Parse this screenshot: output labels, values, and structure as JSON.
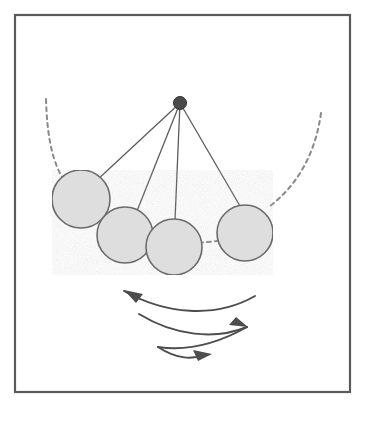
{
  "figure": {
    "title": "Pendulum swinging on a string",
    "type": "physics-diagram",
    "width": 366,
    "height": 421,
    "background_color": "#ffffff"
  },
  "frame": {
    "label": "figure-border",
    "x": 15,
    "y": 15,
    "width": 335,
    "height": 377,
    "stroke_color": "#5a5a5a",
    "stroke_width": 2.2,
    "fill": "none"
  },
  "pivot": {
    "label": "pivot-point",
    "cx": 180,
    "cy": 103,
    "r": 6.5,
    "fill_color": "#4a4a4a",
    "stroke_color": "#2e2e2e"
  },
  "strings": {
    "label": "pendulum-strings",
    "stroke_color": "#5c5c5c",
    "stroke_width": 1.3,
    "lines": [
      {
        "name": "string-to-ball-1",
        "x1": 180,
        "y1": 103,
        "x2": 96,
        "y2": 181
      },
      {
        "name": "string-to-ball-2",
        "x1": 180,
        "y1": 103,
        "x2": 137,
        "y2": 211
      },
      {
        "name": "string-to-ball-3",
        "x1": 180,
        "y1": 103,
        "x2": 175,
        "y2": 220
      },
      {
        "name": "string-to-ball-4",
        "x1": 180,
        "y1": 103,
        "x2": 240,
        "y2": 206
      }
    ]
  },
  "balls": {
    "label": "pendulum-bobs",
    "fill_color": "#dedede",
    "stroke_color": "#6b6b6b",
    "stroke_width": 1.6,
    "items": [
      {
        "name": "bob-position-1",
        "cx": 81,
        "cy": 199,
        "r": 29
      },
      {
        "name": "bob-position-2",
        "cx": 125,
        "cy": 235,
        "r": 28
      },
      {
        "name": "bob-position-3",
        "cx": 174,
        "cy": 247,
        "r": 28
      },
      {
        "name": "bob-position-4",
        "cx": 245,
        "cy": 233,
        "r": 28
      }
    ]
  },
  "dashed_arcs": {
    "label": "swing-path-arcs",
    "stroke_color": "#8a8a8a",
    "stroke_width": 2.0,
    "dash_pattern": "4 4",
    "items": [
      {
        "name": "arc-left-path",
        "path": "M 46 99 C 47 135, 52 164, 66 183"
      },
      {
        "name": "arc-right-path",
        "path": "M 321 113 C 316 150, 300 183, 270 206"
      },
      {
        "name": "arc-center-segment",
        "path": "M 199 243 L 217 241"
      }
    ]
  },
  "motion_arrows": {
    "label": "oscillation-arrows",
    "stroke_color": "#4d4d4d",
    "stroke_width": 2.0,
    "arrowhead_fill": "#4d4d4d",
    "items": [
      {
        "name": "arrow-swing-leftward",
        "path": "M 255 296 C 215 319, 165 314, 124 291",
        "head_points": "124,290 143,294 136,303",
        "direction": "left"
      },
      {
        "name": "arrow-swing-rightward-upper",
        "path": "M 139 314 C 175 336, 215 340, 247 327",
        "head_points": "248,327 229,325 236,317",
        "direction": "right"
      },
      {
        "name": "arrow-swing-leftward-lower",
        "path": "M 247 327 C 215 345, 185 351, 158 347",
        "direction": "left"
      },
      {
        "name": "arrow-swing-rightward-final",
        "path": "M 158 347 C 178 360, 192 359, 206 355",
        "head_points": "212,354 193,350 198,361",
        "direction": "right"
      }
    ]
  },
  "chart_data": {
    "type": "diagram",
    "title": "Pendulum swinging on a string",
    "elements": [
      {
        "kind": "pivot",
        "label": "fixed pivot",
        "x": 180,
        "y": 103
      },
      {
        "kind": "bob",
        "label": "position 1 (far left)",
        "x": 81,
        "y": 199,
        "radius": 29
      },
      {
        "kind": "bob",
        "label": "position 2",
        "x": 125,
        "y": 235,
        "radius": 28
      },
      {
        "kind": "bob",
        "label": "position 3",
        "x": 174,
        "y": 247,
        "radius": 28
      },
      {
        "kind": "bob",
        "label": "position 4 (right)",
        "x": 245,
        "y": 233,
        "radius": 28
      },
      {
        "kind": "arc",
        "label": "left swing extreme (dashed)"
      },
      {
        "kind": "arc",
        "label": "right swing extreme (dashed)"
      },
      {
        "kind": "arrow",
        "label": "swing leftward"
      },
      {
        "kind": "arrow",
        "label": "swing rightward"
      },
      {
        "kind": "arrow",
        "label": "swing leftward (damped)"
      },
      {
        "kind": "arrow",
        "label": "swing rightward (damped)"
      }
    ],
    "string_count": 4,
    "bob_count": 4,
    "arrow_count": 4,
    "grid": false,
    "legend": null
  }
}
